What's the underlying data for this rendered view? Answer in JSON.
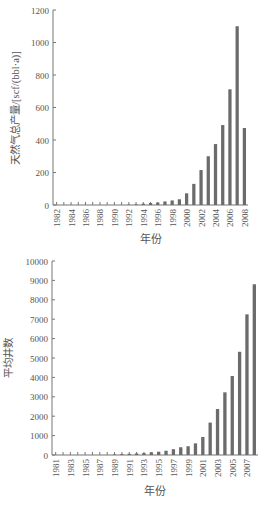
{
  "chart_data": [
    {
      "type": "bar",
      "title": "",
      "xlabel": "年份",
      "ylabel": "天然气总产量/[scf/(bbl·a)]",
      "ylim": [
        0,
        1200
      ],
      "yticks": [
        0,
        200,
        400,
        600,
        800,
        1000,
        1200
      ],
      "grid": false,
      "legend": null,
      "categories": [
        "1982",
        "1983",
        "1984",
        "1985",
        "1986",
        "1987",
        "1988",
        "1989",
        "1990",
        "1991",
        "1992",
        "1993",
        "1994",
        "1995",
        "1996",
        "1997",
        "1998",
        "1999",
        "2000",
        "2001",
        "2002",
        "2003",
        "2004",
        "2005",
        "2006",
        "2007",
        "2008"
      ],
      "xtick_labels": [
        "1982",
        "1984",
        "1986",
        "1988",
        "1990",
        "1992",
        "1994",
        "1996",
        "1998",
        "2000",
        "2002",
        "2004",
        "2006",
        "2008"
      ],
      "values": [
        0,
        0,
        0,
        0,
        0,
        0,
        0,
        0,
        0,
        1,
        2,
        4,
        8,
        12,
        15,
        22,
        28,
        35,
        72,
        130,
        215,
        300,
        375,
        492,
        712,
        1100,
        474
      ],
      "bar_color": "#6b6b6b"
    },
    {
      "type": "bar",
      "title": "",
      "xlabel": "年份",
      "ylabel": "平均井数",
      "ylim": [
        0,
        10000
      ],
      "yticks": [
        0,
        1000,
        2000,
        3000,
        4000,
        5000,
        6000,
        7000,
        8000,
        9000,
        10000
      ],
      "grid": false,
      "legend": null,
      "categories": [
        "1981",
        "1982",
        "1983",
        "1984",
        "1985",
        "1986",
        "1987",
        "1988",
        "1989",
        "1990",
        "1991",
        "1992",
        "1993",
        "1994",
        "1995",
        "1996",
        "1997",
        "1998",
        "1999",
        "2000",
        "2001",
        "2002",
        "2003",
        "2004",
        "2005",
        "2006",
        "2007",
        "2008"
      ],
      "xtick_labels": [
        "1981",
        "1983",
        "1985",
        "1987",
        "1989",
        "1991",
        "1993",
        "1995",
        "1997",
        "1999",
        "2001",
        "2003",
        "2005",
        "2007"
      ],
      "values": [
        5,
        5,
        5,
        5,
        5,
        10,
        10,
        15,
        30,
        50,
        60,
        80,
        100,
        140,
        170,
        220,
        300,
        400,
        450,
        600,
        930,
        1670,
        2370,
        3230,
        4070,
        5320,
        7250,
        8800
      ],
      "bar_color": "#6b6b6b"
    }
  ]
}
